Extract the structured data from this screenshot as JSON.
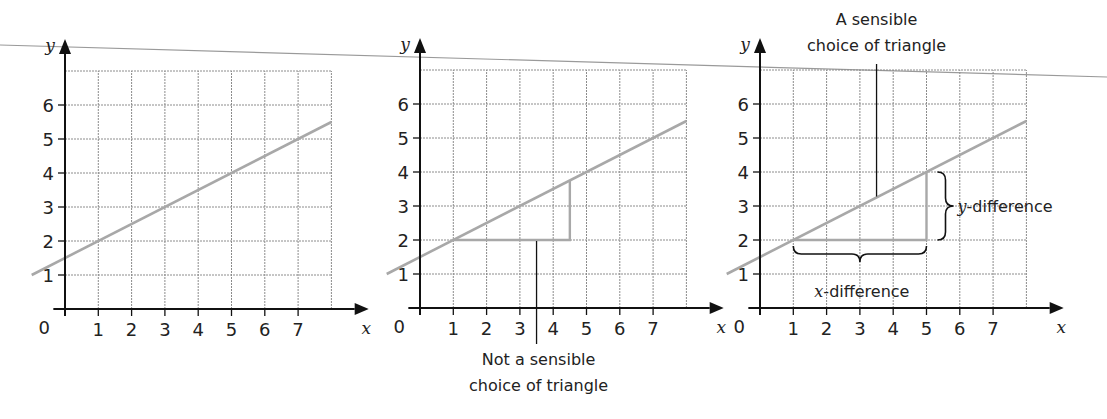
{
  "figure": {
    "rule_line": {
      "x1": 0,
      "y1": 45,
      "x2": 1107,
      "y2": 77,
      "color": "#9a9a9a"
    },
    "colors": {
      "axis": "#111111",
      "grid": "#8c8c8c",
      "line": "#a8a8a8",
      "triangle": "#a8a8a8",
      "text": "#222222",
      "pointer": "#111111"
    },
    "panels": [
      {
        "id": "panel-1",
        "origin_px": [
          65,
          309
        ],
        "x_axis_label": "x",
        "y_axis_label": "y",
        "origin_label": "0",
        "x_ticks": [
          "1",
          "2",
          "3",
          "4",
          "5",
          "6",
          "7"
        ],
        "y_ticks": [
          "1",
          "2",
          "3",
          "4",
          "5",
          "6"
        ]
      },
      {
        "id": "panel-2",
        "origin_px": [
          420,
          308
        ],
        "x_axis_label": "x",
        "y_axis_label": "y",
        "origin_label": "0",
        "x_ticks": [
          "1",
          "2",
          "3",
          "4",
          "5",
          "6",
          "7"
        ],
        "y_ticks": [
          "1",
          "2",
          "3",
          "4",
          "5",
          "6"
        ],
        "triangle": {
          "x_from": 1,
          "x_to": 4.5,
          "y_from": 2,
          "y_to": 3.75
        },
        "callout": {
          "lines": [
            "Not a sensible",
            "choice of triangle"
          ],
          "pointer_x": 3.5
        }
      },
      {
        "id": "panel-3",
        "origin_px": [
          760,
          308
        ],
        "x_axis_label": "x",
        "y_axis_label": "y",
        "origin_label": "0",
        "x_ticks": [
          "1",
          "2",
          "3",
          "4",
          "5",
          "6",
          "7"
        ],
        "y_ticks": [
          "1",
          "2",
          "3",
          "4",
          "5",
          "6"
        ],
        "triangle": {
          "x_from": 1,
          "x_to": 5,
          "y_from": 2,
          "y_to": 4
        },
        "callout": {
          "lines": [
            "A sensible",
            "choice of triangle"
          ],
          "pointer_x": 3.5
        },
        "x_difference_label": {
          "var": "x",
          "text": "-difference"
        },
        "y_difference_label": {
          "var": "y",
          "text": "-difference"
        }
      }
    ]
  },
  "chart_data": {
    "type": "line",
    "title": "",
    "xlabel": "x",
    "ylabel": "y",
    "xlim": [
      0,
      8
    ],
    "ylim": [
      0,
      7
    ],
    "grid": true,
    "series": [
      {
        "name": "line",
        "x": [
          -0.7,
          0,
          1,
          3,
          5,
          7,
          8
        ],
        "values": [
          1.15,
          1.5,
          2,
          3,
          4,
          5,
          5.5
        ]
      }
    ],
    "x_ticks": [
      0,
      1,
      2,
      3,
      4,
      5,
      6,
      7
    ],
    "y_ticks": [
      1,
      2,
      3,
      4,
      5,
      6
    ],
    "annotations": [
      "Not a sensible choice of triangle",
      "A sensible choice of triangle",
      "x-difference",
      "y-difference"
    ],
    "equation": "y = 0.5x + 1.5",
    "gradient": 0.5
  }
}
